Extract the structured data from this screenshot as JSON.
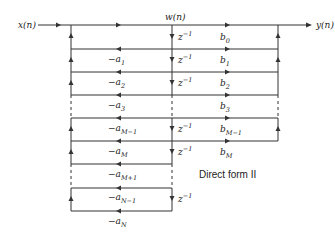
{
  "diagram": {
    "type": "signal-flow",
    "caption": "Direct form II",
    "input_label": "x(n)",
    "output_label": "y(n)",
    "state_label": "w(n)",
    "delay_label": "z",
    "delay_exp": "−1",
    "feedback_gains": [
      {
        "prefix": "−a",
        "sub": "1"
      },
      {
        "prefix": "−a",
        "sub": "2"
      },
      {
        "prefix": "−a",
        "sub": "3"
      },
      {
        "prefix": "−a",
        "sub": "M−1"
      },
      {
        "prefix": "−a",
        "sub": "M"
      },
      {
        "prefix": "−a",
        "sub": "M+1"
      },
      {
        "prefix": "−a",
        "sub": "N−1"
      },
      {
        "prefix": "−a",
        "sub": "N"
      }
    ],
    "feedforward_gains": [
      {
        "prefix": "b",
        "sub": "0"
      },
      {
        "prefix": "b",
        "sub": "1"
      },
      {
        "prefix": "b",
        "sub": "2"
      },
      {
        "prefix": "b",
        "sub": "3"
      },
      {
        "prefix": "b",
        "sub": "M−1"
      },
      {
        "prefix": "b",
        "sub": "M"
      }
    ],
    "line_color": "#333333"
  }
}
